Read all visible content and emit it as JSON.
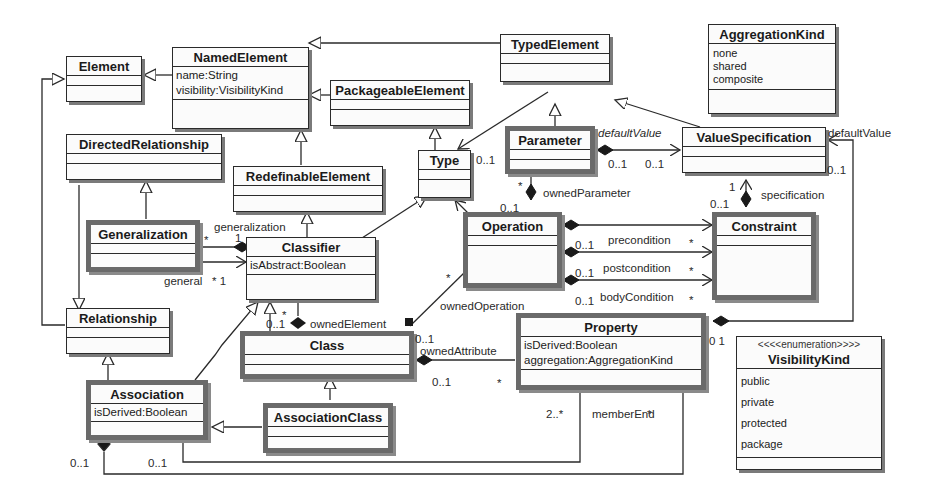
{
  "classes": {
    "element": {
      "name": "Element"
    },
    "named_element": {
      "name": "NamedElement",
      "attributes": [
        "name:String",
        "visibility:VisibilityKind"
      ]
    },
    "typed_element": {
      "name": "TypedElement"
    },
    "packageable_element": {
      "name": "PackageableElement"
    },
    "aggregation_kind": {
      "name": "AggregationKind",
      "literals": [
        "none",
        "shared",
        "composite"
      ]
    },
    "directed_relationship": {
      "name": "DirectedRelationship"
    },
    "redefinable_element": {
      "name": "RedefinableElement"
    },
    "type": {
      "name": "Type"
    },
    "parameter": {
      "name": "Parameter"
    },
    "value_specification": {
      "name": "ValueSpecification"
    },
    "generalization": {
      "name": "Generalization"
    },
    "classifier": {
      "name": "Classifier",
      "attributes": [
        "isAbstract:Boolean"
      ]
    },
    "operation": {
      "name": "Operation"
    },
    "constraint": {
      "name": "Constraint"
    },
    "relationship": {
      "name": "Relationship"
    },
    "class": {
      "name": "Class"
    },
    "property": {
      "name": "Property",
      "attributes": [
        "isDerived:Boolean",
        "aggregation:AggregationKind"
      ]
    },
    "visibility_kind": {
      "stereotype": "<<<<enumeration>>>>",
      "name": "VisibilityKind",
      "literals": [
        "public",
        "private",
        "protected",
        "package"
      ]
    },
    "association": {
      "name": "Association",
      "attributes": [
        "isDerived:Boolean"
      ]
    },
    "association_class": {
      "name": "AssociationClass"
    }
  },
  "labels": {
    "param_default_value": "defaultValue",
    "param_dv_mult_src": "0..1",
    "param_dv_mult_tgt": "0..1",
    "type_mult": "0..1",
    "owned_parameter": "ownedParameter",
    "owned_parameter_star": "*",
    "owned_parameter_mult": "0..1",
    "specification": "specification",
    "spec_mult_1": "1",
    "spec_mult_01": "0..1",
    "vs_default_value": "defaultValue",
    "vs_default_mult": "0..1",
    "generalization_role": "generalization",
    "gen_star": "*",
    "gen_one": "1",
    "general_role": "general",
    "general_mult": "* 1",
    "precondition": "precondition",
    "postcondition": "postcondition",
    "body_condition": "bodyCondition",
    "pre_mult": "0..1",
    "post_mult": "0..1",
    "body_mult": "0..1",
    "pre_star": "*",
    "post_star": "*",
    "body_star": "*",
    "owned_operation": "ownedOperation",
    "owned_operation_star": "*",
    "owned_element": "ownedElement",
    "owned_element_mult": "0..1",
    "owned_element_star": "*",
    "owned_attribute": "ownedAttribute",
    "owned_attr_mult_top": "0..1",
    "owned_attr_mult": "0..1",
    "owned_attr_star": "*",
    "prop_dv_mult": "0 1",
    "member_end": "memberEnd",
    "member_end_star": "*",
    "member_end_mult": "2..*",
    "assoc_mult_left": "0..1",
    "assoc_mult_right": "0..1"
  }
}
